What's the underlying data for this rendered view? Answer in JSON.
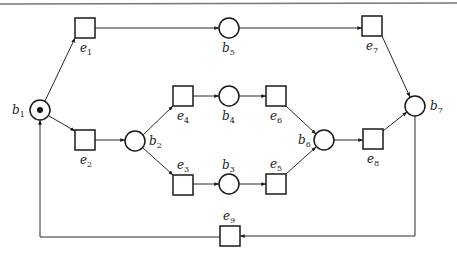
{
  "diagram": {
    "type": "petri-net",
    "colors": {
      "stroke": "#1a1a1a",
      "background": "#ffffff",
      "top_rule": "#777777"
    },
    "places": [
      {
        "id": "b1",
        "base": "b",
        "sub": "1",
        "cx": 40,
        "cy": 110,
        "r": 10,
        "token": true,
        "label_x": 12,
        "label_y": 114
      },
      {
        "id": "b2",
        "base": "b",
        "sub": "2",
        "cx": 135,
        "cy": 141,
        "r": 10,
        "token": false,
        "label_x": 149,
        "label_y": 145
      },
      {
        "id": "b3",
        "base": "b",
        "sub": "3",
        "cx": 229,
        "cy": 184,
        "r": 10,
        "token": false,
        "label_x": 222,
        "label_y": 169
      },
      {
        "id": "b4",
        "base": "b",
        "sub": "4",
        "cx": 229,
        "cy": 96,
        "r": 10,
        "token": false,
        "label_x": 222,
        "label_y": 120
      },
      {
        "id": "b5",
        "base": "b",
        "sub": "5",
        "cx": 229,
        "cy": 28,
        "r": 10,
        "token": false,
        "label_x": 222,
        "label_y": 52
      },
      {
        "id": "b6",
        "base": "b",
        "sub": "6",
        "cx": 324,
        "cy": 140,
        "r": 10,
        "token": false,
        "label_x": 298,
        "label_y": 144
      },
      {
        "id": "b7",
        "base": "b",
        "sub": "7",
        "cx": 415,
        "cy": 106,
        "r": 10,
        "token": false,
        "label_x": 430,
        "label_y": 110
      }
    ],
    "transitions": [
      {
        "id": "e1",
        "base": "e",
        "sub": "1",
        "x": 75,
        "y": 18,
        "w": 20,
        "h": 20,
        "label_x": 80,
        "label_y": 52
      },
      {
        "id": "e2",
        "base": "e",
        "sub": "2",
        "x": 75,
        "y": 130,
        "w": 20,
        "h": 20,
        "label_x": 80,
        "label_y": 164
      },
      {
        "id": "e3",
        "base": "e",
        "sub": "3",
        "x": 173,
        "y": 175,
        "w": 20,
        "h": 20,
        "label_x": 177,
        "label_y": 169
      },
      {
        "id": "e4",
        "base": "e",
        "sub": "4",
        "x": 173,
        "y": 86,
        "w": 20,
        "h": 20,
        "label_x": 177,
        "label_y": 120
      },
      {
        "id": "e5",
        "base": "e",
        "sub": "5",
        "x": 266,
        "y": 174,
        "w": 20,
        "h": 20,
        "label_x": 270,
        "label_y": 168
      },
      {
        "id": "e6",
        "base": "e",
        "sub": "6",
        "x": 266,
        "y": 86,
        "w": 20,
        "h": 20,
        "label_x": 270,
        "label_y": 120
      },
      {
        "id": "e7",
        "base": "e",
        "sub": "7",
        "x": 362,
        "y": 16,
        "w": 20,
        "h": 20,
        "label_x": 366,
        "label_y": 50
      },
      {
        "id": "e8",
        "base": "e",
        "sub": "8",
        "x": 363,
        "y": 129,
        "w": 20,
        "h": 20,
        "label_x": 367,
        "label_y": 163
      },
      {
        "id": "e9",
        "base": "e",
        "sub": "9",
        "x": 220,
        "y": 226,
        "w": 20,
        "h": 20,
        "label_x": 223,
        "label_y": 220
      }
    ],
    "arcs": [
      {
        "from": "b1",
        "to": "e1",
        "points": [
          [
            45,
            101
          ],
          [
            75,
            38
          ]
        ]
      },
      {
        "from": "b1",
        "to": "e2",
        "points": [
          [
            49,
            116
          ],
          [
            75,
            131
          ]
        ]
      },
      {
        "from": "e1",
        "to": "b5",
        "points": [
          [
            95,
            28
          ],
          [
            219,
            28
          ]
        ]
      },
      {
        "from": "e2",
        "to": "b2",
        "points": [
          [
            95,
            140
          ],
          [
            125,
            140
          ]
        ]
      },
      {
        "from": "b2",
        "to": "e4",
        "points": [
          [
            143,
            135
          ],
          [
            173,
            106
          ]
        ]
      },
      {
        "from": "b2",
        "to": "e3",
        "points": [
          [
            143,
            148
          ],
          [
            173,
            175
          ]
        ]
      },
      {
        "from": "e4",
        "to": "b4",
        "points": [
          [
            193,
            96
          ],
          [
            219,
            96
          ]
        ]
      },
      {
        "from": "e3",
        "to": "b3",
        "points": [
          [
            193,
            184
          ],
          [
            219,
            184
          ]
        ]
      },
      {
        "from": "b4",
        "to": "e6",
        "points": [
          [
            239,
            96
          ],
          [
            266,
            96
          ]
        ]
      },
      {
        "from": "b3",
        "to": "e5",
        "points": [
          [
            239,
            184
          ],
          [
            266,
            184
          ]
        ]
      },
      {
        "from": "e6",
        "to": "b6",
        "points": [
          [
            286,
            106
          ],
          [
            316,
            134
          ]
        ]
      },
      {
        "from": "e5",
        "to": "b6",
        "points": [
          [
            286,
            174
          ],
          [
            316,
            147
          ]
        ]
      },
      {
        "from": "b6",
        "to": "e8",
        "points": [
          [
            334,
            140
          ],
          [
            363,
            140
          ]
        ]
      },
      {
        "from": "b5",
        "to": "e7",
        "points": [
          [
            239,
            28
          ],
          [
            362,
            28
          ]
        ]
      },
      {
        "from": "e7",
        "to": "b7",
        "points": [
          [
            382,
            36
          ],
          [
            410,
            97
          ]
        ]
      },
      {
        "from": "e8",
        "to": "b7",
        "points": [
          [
            383,
            131
          ],
          [
            407,
            112
          ]
        ]
      },
      {
        "from": "b7",
        "to": "e9",
        "points": [
          [
            415,
            116
          ],
          [
            415,
            236
          ],
          [
            240,
            236
          ]
        ]
      },
      {
        "from": "e9",
        "to": "b1",
        "points": [
          [
            220,
            237
          ],
          [
            40,
            237
          ],
          [
            40,
            120
          ]
        ]
      }
    ]
  }
}
